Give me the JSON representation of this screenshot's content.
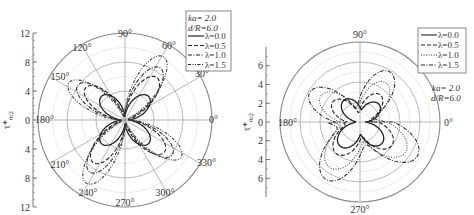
{
  "chart_data": [
    {
      "type": "polar-line",
      "title": "",
      "ylabel": "τ*_θ_{r2}",
      "params": {
        "ka": "ka= 2.0",
        "dR": "d/R=6.0"
      },
      "radial_axis": {
        "ticks_upper": [
          "12",
          "8",
          "4",
          "0"
        ],
        "ticks_lower": [
          "4",
          "8",
          "12"
        ],
        "range": [
          0,
          12
        ]
      },
      "angle_labels": [
        "0°",
        "30°",
        "60°",
        "90°",
        "120°",
        "150°",
        "180°",
        "210°",
        "240°",
        "270°",
        "300°",
        "330°"
      ],
      "legend": [
        "λ=0.0",
        "λ=0.5",
        "λ=1.0",
        "λ=1.5"
      ],
      "series": [
        {
          "name": "λ=0.0",
          "style": "solid",
          "description": "four-lobed clover, peak ~4.5 at 45°,135°,225°,315°"
        },
        {
          "name": "λ=0.5",
          "style": "dashed",
          "peak": 7.5
        },
        {
          "name": "λ=1.0",
          "style": "dash-dot",
          "peak": 9
        },
        {
          "name": "λ=1.5",
          "style": "dash-dot-dot",
          "peak": 10.5
        }
      ]
    },
    {
      "type": "polar-line",
      "title": "",
      "ylabel": "τ*_θ_{r2}",
      "params": {
        "ka": "ka= 2.0",
        "dR": "d/R=6.0"
      },
      "radial_axis": {
        "ticks_upper": [
          "6",
          "4",
          "2",
          "0"
        ],
        "ticks_lower": [
          "2",
          "4",
          "6"
        ],
        "range": [
          0,
          8
        ]
      },
      "angle_labels": [
        "0°",
        "90°",
        "180°",
        "270°"
      ],
      "legend": [
        "λ=0.0",
        "λ=0.5",
        "λ=1.0",
        "λ=1.5"
      ],
      "series": [
        {
          "name": "λ=0.0",
          "style": "solid",
          "peak": 2.8
        },
        {
          "name": "λ=0.5",
          "style": "dashed",
          "peak": 4.2
        },
        {
          "name": "λ=1.0",
          "style": "dotted",
          "peak": 5.5
        },
        {
          "name": "λ=1.5",
          "style": "dash-dot",
          "peak": 6.8
        }
      ]
    }
  ]
}
